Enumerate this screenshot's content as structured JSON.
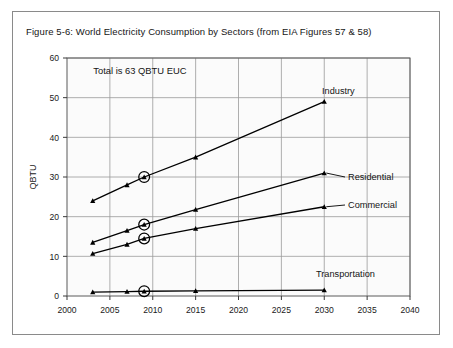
{
  "figure": {
    "title": "Figure 5-6:  World Electricity Consumption by Sectors (from EIA Figures 57 & 58)",
    "annotation": "Total is 63 QBTU EUC"
  },
  "chart_data": {
    "type": "line",
    "title": "Figure 5-6:  World Electricity Consumption by Sectors (from EIA Figures 57 & 58)",
    "xlabel": "",
    "ylabel": "QBTU",
    "xlim": [
      2000,
      2040
    ],
    "ylim": [
      0,
      60
    ],
    "xticks": [
      2000,
      2005,
      2010,
      2015,
      2020,
      2025,
      2030,
      2035,
      2040
    ],
    "yticks": [
      0,
      10,
      20,
      30,
      40,
      50,
      60
    ],
    "grid": true,
    "legend_position": "inline-right-of-line-end",
    "annotations": [
      {
        "text": "Total is 63 QBTU EUC",
        "x": 2008.5,
        "y": 56
      }
    ],
    "highlight_marker": {
      "style": "circled",
      "x": 2009,
      "description": "Circled data points at year 2009 on every series"
    },
    "x": [
      2003,
      2007,
      2009,
      2015,
      2030
    ],
    "series": [
      {
        "name": "Industry",
        "values": [
          24.0,
          28.0,
          30.0,
          35.0,
          49.0
        ],
        "circled_index": 2,
        "color": "#000000"
      },
      {
        "name": "Residential",
        "values": [
          13.5,
          16.5,
          18.0,
          21.8,
          31.0
        ],
        "circled_index": 2,
        "color": "#000000"
      },
      {
        "name": "Commercial",
        "values": [
          10.7,
          13.0,
          14.5,
          17.0,
          22.5
        ],
        "circled_index": 2,
        "color": "#000000"
      },
      {
        "name": "Transportation",
        "values": [
          1.0,
          1.1,
          1.2,
          1.3,
          1.5
        ],
        "circled_index": 2,
        "color": "#000000"
      }
    ],
    "series_label_positions": [
      {
        "name": "Industry",
        "x": 322,
        "y": 94
      },
      {
        "name": "Residential",
        "x": 348,
        "y": 180
      },
      {
        "name": "Commercial",
        "x": 348,
        "y": 208
      },
      {
        "name": "Transportation",
        "x": 316,
        "y": 277
      }
    ]
  }
}
